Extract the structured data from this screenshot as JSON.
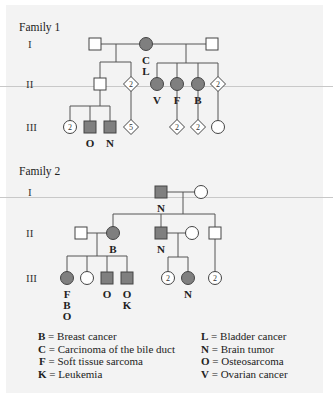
{
  "colors": {
    "affected_fill": "#7f7f7f",
    "unaffected_fill": "#ffffff",
    "background": "#f3f3f3"
  },
  "generation_labels": [
    "I",
    "II",
    "III"
  ],
  "families": [
    {
      "title": "Family 1",
      "individuals": [
        {
          "id": "f1-I-1",
          "generation": "I",
          "sex": "male",
          "affected": false,
          "count": null,
          "codes": []
        },
        {
          "id": "f1-I-2",
          "generation": "I",
          "sex": "female",
          "affected": true,
          "count": null,
          "codes": [
            "C",
            "L"
          ]
        },
        {
          "id": "f1-I-3",
          "generation": "I",
          "sex": "male",
          "affected": false,
          "count": null,
          "codes": []
        },
        {
          "id": "f1-II-1",
          "generation": "II",
          "sex": "male",
          "affected": false,
          "count": null,
          "codes": []
        },
        {
          "id": "f1-II-2",
          "generation": "II",
          "sex": "unknown",
          "affected": false,
          "count": "2",
          "codes": []
        },
        {
          "id": "f1-II-3",
          "generation": "II",
          "sex": "female",
          "affected": true,
          "count": null,
          "codes": [
            "V"
          ]
        },
        {
          "id": "f1-II-4",
          "generation": "II",
          "sex": "female",
          "affected": true,
          "count": null,
          "codes": [
            "F"
          ]
        },
        {
          "id": "f1-II-5",
          "generation": "II",
          "sex": "female",
          "affected": true,
          "count": null,
          "codes": [
            "B"
          ]
        },
        {
          "id": "f1-II-6",
          "generation": "II",
          "sex": "unknown",
          "affected": false,
          "count": "2",
          "codes": []
        },
        {
          "id": "f1-III-1",
          "generation": "III",
          "sex": "female",
          "affected": false,
          "count": "2",
          "codes": []
        },
        {
          "id": "f1-III-2",
          "generation": "III",
          "sex": "male",
          "affected": true,
          "count": null,
          "codes": [
            "O"
          ]
        },
        {
          "id": "f1-III-3",
          "generation": "III",
          "sex": "male",
          "affected": true,
          "count": null,
          "codes": [
            "N"
          ]
        },
        {
          "id": "f1-III-4",
          "generation": "III",
          "sex": "unknown",
          "affected": false,
          "count": "5",
          "codes": []
        },
        {
          "id": "f1-III-5",
          "generation": "III",
          "sex": "unknown",
          "affected": false,
          "count": "2",
          "codes": []
        },
        {
          "id": "f1-III-6",
          "generation": "III",
          "sex": "unknown",
          "affected": false,
          "count": "2",
          "codes": []
        },
        {
          "id": "f1-III-7",
          "generation": "III",
          "sex": "female",
          "affected": false,
          "count": null,
          "codes": []
        }
      ]
    },
    {
      "title": "Family 2",
      "individuals": [
        {
          "id": "f2-I-1",
          "generation": "I",
          "sex": "male",
          "affected": true,
          "count": null,
          "codes": [
            "N"
          ]
        },
        {
          "id": "f2-I-2",
          "generation": "I",
          "sex": "female",
          "affected": false,
          "count": null,
          "codes": []
        },
        {
          "id": "f2-II-1",
          "generation": "II",
          "sex": "male",
          "affected": false,
          "count": null,
          "codes": []
        },
        {
          "id": "f2-II-2",
          "generation": "II",
          "sex": "female",
          "affected": true,
          "count": null,
          "codes": [
            "B"
          ]
        },
        {
          "id": "f2-II-3",
          "generation": "II",
          "sex": "male",
          "affected": true,
          "count": null,
          "codes": [
            "N"
          ]
        },
        {
          "id": "f2-II-4",
          "generation": "II",
          "sex": "female",
          "affected": false,
          "count": null,
          "codes": []
        },
        {
          "id": "f2-II-5",
          "generation": "II",
          "sex": "male",
          "affected": false,
          "count": null,
          "codes": []
        },
        {
          "id": "f2-III-1",
          "generation": "III",
          "sex": "female",
          "affected": true,
          "count": null,
          "codes": [
            "F",
            "B",
            "O"
          ]
        },
        {
          "id": "f2-III-2",
          "generation": "III",
          "sex": "female",
          "affected": false,
          "count": null,
          "codes": []
        },
        {
          "id": "f2-III-3",
          "generation": "III",
          "sex": "male",
          "affected": true,
          "count": null,
          "codes": [
            "O"
          ]
        },
        {
          "id": "f2-III-4",
          "generation": "III",
          "sex": "male",
          "affected": true,
          "count": null,
          "codes": [
            "O",
            "K"
          ]
        },
        {
          "id": "f2-III-5",
          "generation": "III",
          "sex": "female",
          "affected": false,
          "count": "2",
          "codes": []
        },
        {
          "id": "f2-III-6",
          "generation": "III",
          "sex": "female",
          "affected": true,
          "count": null,
          "codes": [
            "N"
          ]
        },
        {
          "id": "f2-III-7",
          "generation": "III",
          "sex": "female",
          "affected": false,
          "count": "2",
          "codes": []
        }
      ]
    }
  ],
  "legend": {
    "left": [
      {
        "code": "B",
        "meaning": "Breast cancer"
      },
      {
        "code": "C",
        "meaning": "Carcinoma of the bile duct"
      },
      {
        "code": "F",
        "meaning": "Soft tissue sarcoma"
      },
      {
        "code": "K",
        "meaning": "Leukemia"
      }
    ],
    "right": [
      {
        "code": "L",
        "meaning": "Bladder cancer"
      },
      {
        "code": "N",
        "meaning": "Brain tumor"
      },
      {
        "code": "O",
        "meaning": "Osteosarcoma"
      },
      {
        "code": "V",
        "meaning": "Ovarian cancer"
      }
    ]
  }
}
